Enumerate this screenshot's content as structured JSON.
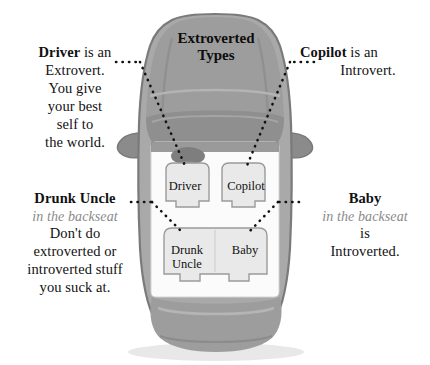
{
  "diagram": {
    "title": "Extroverted\nTypes",
    "colors": {
      "car_body": "#a9a9a9",
      "car_body_dark": "#8b8b8b",
      "car_outline": "#7a7a7a",
      "cabin_interior": "#fbfbfb",
      "seat_fill": "#e9e9e9",
      "seat_stroke": "#9b9b9b",
      "leader_line": "#111111",
      "text": "#111111",
      "subtext_gray": "#8a8a8a",
      "background": "#ffffff"
    }
  },
  "seats": [
    {
      "id": "driver",
      "label": "Driver",
      "position": "front-left"
    },
    {
      "id": "copilot",
      "label": "Copilot",
      "position": "front-right"
    },
    {
      "id": "uncle",
      "label": "Drunk\nUncle",
      "position": "rear-left"
    },
    {
      "id": "baby",
      "label": "Baby",
      "position": "rear-right"
    }
  ],
  "annotations": {
    "driver": {
      "lead": "Driver",
      "lead_rest": " is an",
      "lines": [
        "Extrovert.",
        "You give",
        "your best",
        "self to",
        "the world."
      ]
    },
    "copilot": {
      "lead": "Copilot",
      "lead_rest": " is an",
      "lines": [
        "Introvert."
      ]
    },
    "uncle": {
      "lead": "Drunk Uncle",
      "sub": "in the backseat",
      "lines": [
        "Don't do",
        "extroverted or",
        "introverted stuff",
        "you suck at."
      ]
    },
    "baby": {
      "lead": "Baby",
      "sub": "in the backseat",
      "lines": [
        "is",
        "Introverted."
      ]
    }
  }
}
